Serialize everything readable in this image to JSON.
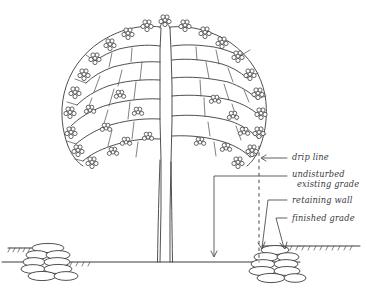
{
  "drawing": {
    "title": "Tree preservation with retaining wall section",
    "background_color": "#ffffff",
    "ink_color": "#3c3c42"
  },
  "labels": {
    "drip_line": "drip line",
    "undisturbed_existing_grade_line1": "undisturbed",
    "undisturbed_existing_grade_line2": "existing grade",
    "retaining_wall": "retaining wall",
    "finished_grade": "finished grade"
  },
  "elements": {
    "tree": "deciduous-tree-elevation",
    "canopy": "foliage-canopy",
    "trunk": "tree-trunk",
    "left_wall": "stone-retaining-wall-left",
    "right_wall": "stone-retaining-wall-right",
    "ground": "existing-grade-line",
    "drip_line_marker": "dashed-drip-line"
  }
}
